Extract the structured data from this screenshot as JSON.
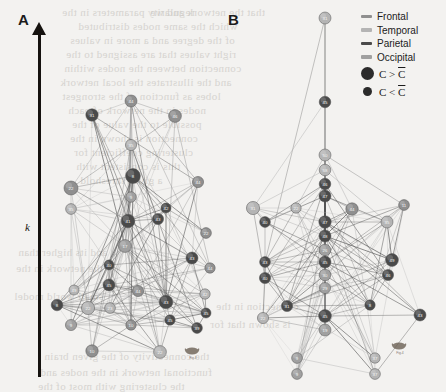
{
  "figure": {
    "width": 446,
    "height": 392,
    "background_color": "#f3f2f0"
  },
  "panels": [
    {
      "id": "A",
      "label": "A",
      "x": 18,
      "y": 11
    },
    {
      "id": "B",
      "label": "B",
      "x": 228,
      "y": 11
    }
  ],
  "axis": {
    "name": "k-axis",
    "label": "k",
    "direction": "up",
    "color": "#15120f"
  },
  "legend": {
    "lobes": [
      {
        "label": "Frontal",
        "color": "#8f8f8f"
      },
      {
        "label": "Temporal",
        "color": "#b4b4b4"
      },
      {
        "label": "Parietal",
        "color": "#4a4a4a"
      },
      {
        "label": "Occipital",
        "color": "#a0a0a0"
      }
    ],
    "node_size_items": [
      {
        "label": "C > C̄",
        "label_base": "C > C",
        "size": "big",
        "color": "#2b2b2b"
      },
      {
        "label": "C < C̄",
        "label_base": "C < C",
        "size": "small",
        "color": "#2b2b2b"
      }
    ]
  },
  "watermarks": [
    {
      "text": "Fig.4",
      "x": 183,
      "y": 345
    },
    {
      "text": "Fig.4",
      "x": 390,
      "y": 340
    }
  ],
  "bleed_text": [
    {
      "text": "regularity parameters in the",
      "x": 62,
      "y": 6,
      "size": 11
    },
    {
      "text": "that the network and we",
      "x": 150,
      "y": 6,
      "size": 11
    },
    {
      "text": "which the same nodes distributed",
      "x": 78,
      "y": 20,
      "size": 11
    },
    {
      "text": "of the degree and a more in values",
      "x": 70,
      "y": 34,
      "size": 11
    },
    {
      "text": "right values that are assigned to the",
      "x": 66,
      "y": 48,
      "size": 11
    },
    {
      "text": "connection between the nodes within",
      "x": 64,
      "y": 62,
      "size": 11
    },
    {
      "text": "and the illustrates the local network",
      "x": 60,
      "y": 76,
      "size": 11
    },
    {
      "text": "lobes as function of the strongest",
      "x": 62,
      "y": 90,
      "size": 11
    },
    {
      "text": "nodes in the network of each",
      "x": 68,
      "y": 104,
      "size": 11
    },
    {
      "text": "possible to the value of the",
      "x": 72,
      "y": 118,
      "size": 11
    },
    {
      "text": "connection is shown in the",
      "x": 70,
      "y": 132,
      "size": 11
    },
    {
      "text": "clustering coefficient for",
      "x": 74,
      "y": 146,
      "size": 11
    },
    {
      "text": "this is consistent with",
      "x": 76,
      "y": 160,
      "size": 11
    },
    {
      "text": "a given threshold",
      "x": 80,
      "y": 174,
      "size": 11
    },
    {
      "text": "and its higher than",
      "x": 18,
      "y": 246,
      "size": 11
    },
    {
      "text": "the network in the",
      "x": 16,
      "y": 262,
      "size": 11
    },
    {
      "text": "small world model",
      "x": 14,
      "y": 290,
      "size": 11
    },
    {
      "text": "connection in the",
      "x": 216,
      "y": 300,
      "size": 11
    },
    {
      "text": "is shown that for",
      "x": 210,
      "y": 318,
      "size": 11
    },
    {
      "text": "the connectivity of the given brain",
      "x": 44,
      "y": 350,
      "size": 11
    },
    {
      "text": "functional network in the nodes and",
      "x": 40,
      "y": 366,
      "size": 11
    },
    {
      "text": "the clustering with most of the",
      "x": 38,
      "y": 380,
      "size": 11
    }
  ],
  "chart_data": {
    "type": "diagram",
    "panelA": {
      "label": "A",
      "nodes": [
        {
          "id": "44",
          "x": 131,
          "y": 101,
          "r": 6.0,
          "lobe": "Frontal"
        },
        {
          "id": "31",
          "x": 92,
          "y": 115,
          "r": 6.2,
          "lobe": "Parietal"
        },
        {
          "id": "46",
          "x": 175,
          "y": 116,
          "r": 6.4,
          "lobe": "Frontal"
        },
        {
          "id": "35",
          "x": 131,
          "y": 145,
          "r": 5.6,
          "lobe": "Temporal"
        },
        {
          "id": "44",
          "x": 198,
          "y": 182,
          "r": 5.6,
          "lobe": "Frontal"
        },
        {
          "id": "8",
          "x": 133,
          "y": 176,
          "r": 7.4,
          "lobe": "Parietal"
        },
        {
          "id": "22",
          "x": 71,
          "y": 188,
          "r": 7.0,
          "lobe": "Frontal"
        },
        {
          "id": "9",
          "x": 131,
          "y": 197,
          "r": 5.3,
          "lobe": "Occipital"
        },
        {
          "id": "35",
          "x": 71,
          "y": 209,
          "r": 5.4,
          "lobe": "Temporal"
        },
        {
          "id": "42",
          "x": 166,
          "y": 208,
          "r": 5.0,
          "lobe": "Parietal"
        },
        {
          "id": "43",
          "x": 158,
          "y": 219,
          "r": 5.6,
          "lobe": "Parietal"
        },
        {
          "id": "41",
          "x": 128,
          "y": 221,
          "r": 6.8,
          "lobe": "Parietal"
        },
        {
          "id": "22",
          "x": 206,
          "y": 233,
          "r": 5.4,
          "lobe": "Frontal"
        },
        {
          "id": "17",
          "x": 125,
          "y": 246,
          "r": 6.4,
          "lobe": "Occipital"
        },
        {
          "id": "43",
          "x": 192,
          "y": 258,
          "r": 6.0,
          "lobe": "Parietal"
        },
        {
          "id": "44",
          "x": 210,
          "y": 268,
          "r": 5.2,
          "lobe": "Frontal"
        },
        {
          "id": "40",
          "x": 109,
          "y": 265,
          "r": 5.0,
          "lobe": "Parietal"
        },
        {
          "id": "45",
          "x": 109,
          "y": 285,
          "r": 6.0,
          "lobe": "Parietal"
        },
        {
          "id": "49",
          "x": 74,
          "y": 290,
          "r": 5.0,
          "lobe": "Temporal"
        },
        {
          "id": "44",
          "x": 138,
          "y": 291,
          "r": 5.6,
          "lobe": "Frontal"
        },
        {
          "id": "42",
          "x": 205,
          "y": 294,
          "r": 5.2,
          "lobe": "Temporal"
        },
        {
          "id": "8",
          "x": 57,
          "y": 305,
          "r": 5.8,
          "lobe": "Parietal"
        },
        {
          "id": "43",
          "x": 166,
          "y": 302,
          "r": 6.8,
          "lobe": "Parietal"
        },
        {
          "id": "23",
          "x": 110,
          "y": 308,
          "r": 5.4,
          "lobe": "Temporal"
        },
        {
          "id": "45",
          "x": 206,
          "y": 313,
          "r": 5.0,
          "lobe": "Parietal"
        },
        {
          "id": "22",
          "x": 88,
          "y": 308,
          "r": 6.6,
          "lobe": "Temporal"
        },
        {
          "id": "9",
          "x": 71,
          "y": 325,
          "r": 5.6,
          "lobe": "Occipital"
        },
        {
          "id": "45",
          "x": 170,
          "y": 320,
          "r": 5.2,
          "lobe": "Parietal"
        },
        {
          "id": "10",
          "x": 131,
          "y": 325,
          "r": 5.2,
          "lobe": "Frontal"
        },
        {
          "id": "39",
          "x": 197,
          "y": 328,
          "r": 5.4,
          "lobe": "Parietal"
        },
        {
          "id": "10",
          "x": 92,
          "y": 351,
          "r": 6.2,
          "lobe": "Frontal"
        },
        {
          "id": "22",
          "x": 160,
          "y": 352,
          "r": 6.4,
          "lobe": "Temporal"
        }
      ]
    },
    "panelB": {
      "label": "B",
      "nodes": [
        {
          "id": "31",
          "x": 325,
          "y": 18,
          "r": 6.0,
          "lobe": "Temporal"
        },
        {
          "id": "45",
          "x": 325,
          "y": 102,
          "r": 5.8,
          "lobe": "Parietal"
        },
        {
          "id": "50",
          "x": 325,
          "y": 155,
          "r": 6.0,
          "lobe": "Temporal"
        },
        {
          "id": "58",
          "x": 325,
          "y": 170,
          "r": 5.8,
          "lobe": "Temporal"
        },
        {
          "id": "46",
          "x": 325,
          "y": 184,
          "r": 5.8,
          "lobe": "Parietal"
        },
        {
          "id": "47",
          "x": 325,
          "y": 196,
          "r": 6.0,
          "lobe": "Parietal"
        },
        {
          "id": "31",
          "x": 253,
          "y": 208,
          "r": 6.6,
          "lobe": "Temporal"
        },
        {
          "id": "22",
          "x": 296,
          "y": 208,
          "r": 5.2,
          "lobe": "Temporal"
        },
        {
          "id": "44",
          "x": 352,
          "y": 209,
          "r": 6.2,
          "lobe": "Frontal"
        },
        {
          "id": "11",
          "x": 404,
          "y": 205,
          "r": 5.4,
          "lobe": "Frontal"
        },
        {
          "id": "40",
          "x": 265,
          "y": 222,
          "r": 5.4,
          "lobe": "Parietal"
        },
        {
          "id": "47",
          "x": 325,
          "y": 222,
          "r": 6.2,
          "lobe": "Parietal"
        },
        {
          "id": "35",
          "x": 387,
          "y": 222,
          "r": 6.0,
          "lobe": "Temporal"
        },
        {
          "id": "48",
          "x": 325,
          "y": 236,
          "r": 6.0,
          "lobe": "Parietal"
        },
        {
          "id": "26",
          "x": 325,
          "y": 250,
          "r": 5.8,
          "lobe": "Occipital"
        },
        {
          "id": "49",
          "x": 392,
          "y": 260,
          "r": 6.4,
          "lobe": "Parietal"
        },
        {
          "id": "45",
          "x": 325,
          "y": 262,
          "r": 6.0,
          "lobe": "Parietal"
        },
        {
          "id": "43",
          "x": 265,
          "y": 262,
          "r": 5.4,
          "lobe": "Parietal"
        },
        {
          "id": "40",
          "x": 265,
          "y": 278,
          "r": 5.6,
          "lobe": "Parietal"
        },
        {
          "id": "30",
          "x": 325,
          "y": 275,
          "r": 5.8,
          "lobe": "Occipital"
        },
        {
          "id": "46",
          "x": 388,
          "y": 275,
          "r": 5.6,
          "lobe": "Parietal"
        },
        {
          "id": "29",
          "x": 325,
          "y": 288,
          "r": 5.6,
          "lobe": "Occipital"
        },
        {
          "id": "31",
          "x": 287,
          "y": 306,
          "r": 5.6,
          "lobe": "Parietal"
        },
        {
          "id": "8",
          "x": 370,
          "y": 305,
          "r": 5.2,
          "lobe": "Parietal"
        },
        {
          "id": "45",
          "x": 325,
          "y": 316,
          "r": 6.4,
          "lobe": "Parietal"
        },
        {
          "id": "43",
          "x": 420,
          "y": 315,
          "r": 6.0,
          "lobe": "Parietal"
        },
        {
          "id": "19",
          "x": 325,
          "y": 330,
          "r": 6.0,
          "lobe": "Occipital"
        },
        {
          "id": "22",
          "x": 263,
          "y": 318,
          "r": 5.6,
          "lobe": "Temporal"
        },
        {
          "id": "9",
          "x": 297,
          "y": 358,
          "r": 5.4,
          "lobe": "Occipital"
        },
        {
          "id": "9",
          "x": 297,
          "y": 374,
          "r": 5.4,
          "lobe": "Occipital"
        },
        {
          "id": "37",
          "x": 375,
          "y": 358,
          "r": 5.2,
          "lobe": "Temporal"
        },
        {
          "id": "37",
          "x": 375,
          "y": 374,
          "r": 5.4,
          "lobe": "Temporal"
        }
      ]
    }
  }
}
